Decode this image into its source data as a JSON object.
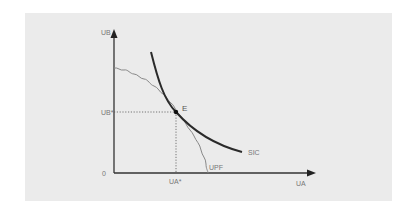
{
  "diagram": {
    "type": "economics-welfare-diagram",
    "colors": {
      "background": "#ffffff",
      "panel": "#ebebeb",
      "axis": "#333333",
      "sic_curve": "#2a2a2a",
      "upf_curve": "#888888",
      "guide_lines": "#555555",
      "labels": "#777777"
    },
    "axes": {
      "y_label": "UB",
      "x_label": "UA",
      "origin_label": "0"
    },
    "point": {
      "label": "E",
      "x_value_label": "UA*",
      "y_value_label": "UB*"
    },
    "curves": {
      "sic_label": "SIC",
      "upf_label": "UPF"
    }
  }
}
